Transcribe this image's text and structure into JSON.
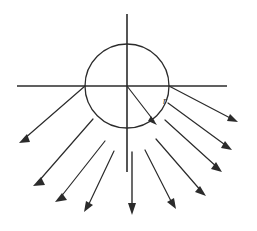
{
  "figure": {
    "background_color": "#ffffff",
    "stroke_color": "#2b2b2b",
    "width": 257,
    "height": 231
  },
  "circle": {
    "name": "central-circle",
    "center_x": 127,
    "center_y": 86,
    "radius": 42,
    "stroke_width": 1.3
  },
  "axes": {
    "horizontal": {
      "label": "horizontal-axis-line",
      "x1": 17,
      "y1": 86,
      "x2": 227,
      "y2": 86,
      "stroke_width": 1.6
    },
    "vertical": {
      "label": "vertical-axis-line",
      "x1": 127,
      "y1": 14,
      "x2": 127,
      "y2": 172,
      "stroke_width": 1.6
    }
  },
  "radius_indicator": {
    "name": "radius-arrow",
    "label": "r",
    "label_x": 163,
    "label_y": 104,
    "x1": 127,
    "y1": 86,
    "x2": 157,
    "y2": 124,
    "stroke_width": 1.2
  },
  "down_arrow": {
    "name": "downward-axis-arrow",
    "x1": 132,
    "y1": 152,
    "x2": 132,
    "y2": 214,
    "stroke_width": 1.4
  },
  "rays": [
    {
      "id": "ray-left-1",
      "angle_deg": 180,
      "x1": 85,
      "y1": 86,
      "x2": 20,
      "y2": 143,
      "stroke_width": 1.2
    },
    {
      "id": "ray-left-2",
      "angle_deg": 202,
      "x1": 93,
      "y1": 119,
      "x2": 34,
      "y2": 186,
      "stroke_width": 1.2
    },
    {
      "id": "ray-left-3",
      "angle_deg": 222,
      "x1": 105,
      "y1": 141,
      "x2": 56,
      "y2": 202,
      "stroke_width": 1.2
    },
    {
      "id": "ray-left-4",
      "angle_deg": 242,
      "x1": 114,
      "y1": 151,
      "x2": 84,
      "y2": 212,
      "stroke_width": 1.2
    },
    {
      "id": "ray-center",
      "angle_deg": 270,
      "x1": 132,
      "y1": 152,
      "x2": 132,
      "y2": 214,
      "stroke_width": 1.4
    },
    {
      "id": "ray-right-1",
      "angle_deg": 298,
      "x1": 145,
      "y1": 150,
      "x2": 176,
      "y2": 209,
      "stroke_width": 1.2
    },
    {
      "id": "ray-right-2",
      "angle_deg": 318,
      "x1": 156,
      "y1": 139,
      "x2": 206,
      "y2": 196,
      "stroke_width": 1.2
    },
    {
      "id": "ray-right-3",
      "angle_deg": 336,
      "x1": 165,
      "y1": 120,
      "x2": 222,
      "y2": 172,
      "stroke_width": 1.2
    },
    {
      "id": "ray-right-4",
      "angle_deg": 350,
      "x1": 168,
      "y1": 103,
      "x2": 232,
      "y2": 150,
      "stroke_width": 1.2
    },
    {
      "id": "ray-right-5",
      "angle_deg": 0,
      "x1": 169,
      "y1": 86,
      "x2": 238,
      "y2": 122,
      "stroke_width": 1.2
    }
  ]
}
